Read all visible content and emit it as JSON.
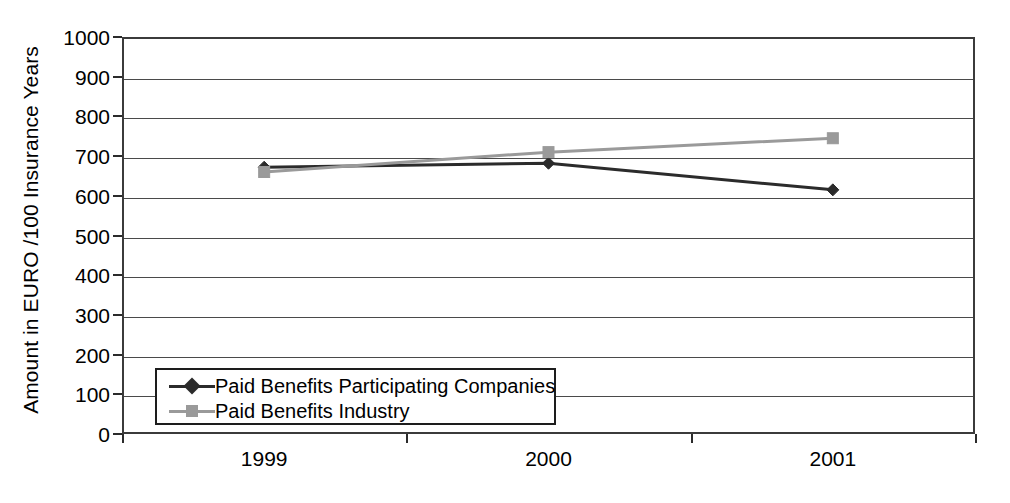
{
  "chart_data": {
    "type": "line",
    "title": "",
    "xlabel": "",
    "ylabel": "Amount in EURO /100 Insurance Years",
    "categories": [
      "1999",
      "2000",
      "2001"
    ],
    "ylim": [
      0,
      1000
    ],
    "yticks": [
      0,
      100,
      200,
      300,
      400,
      500,
      600,
      700,
      800,
      900,
      1000
    ],
    "ytick_labels": [
      "0",
      "100",
      "200",
      "300",
      "400",
      "500",
      "600",
      "700",
      "800",
      "900",
      "1000"
    ],
    "grid": true,
    "legend_position": "inside-bottom-left",
    "series": [
      {
        "name": "Paid Benefits Participating Companies",
        "values": [
          672,
          682,
          615
        ],
        "color": "#2b2b2b",
        "marker": "diamond"
      },
      {
        "name": "Paid Benefits Industry",
        "values": [
          660,
          710,
          745
        ],
        "color": "#9a9a9a",
        "marker": "square"
      }
    ]
  },
  "legend": {
    "items": [
      {
        "label": "Paid Benefits Participating Companies"
      },
      {
        "label": "Paid Benefits Industry"
      }
    ]
  }
}
